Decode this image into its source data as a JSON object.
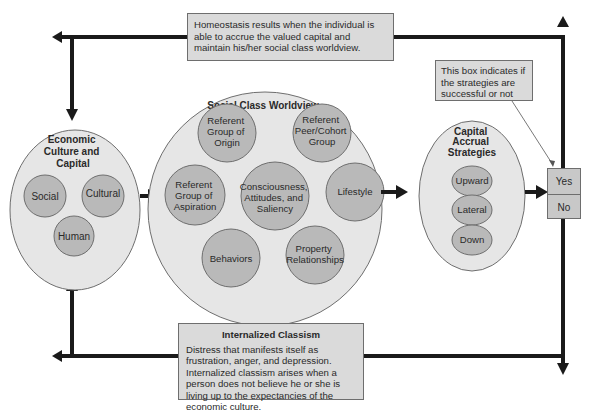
{
  "top_box": {
    "text": "Homeostasis results when the individual is able to accrue the valued capital and maintain his/her social class worldview."
  },
  "note_box": {
    "text": "This box indicates if the strategies are successful or not"
  },
  "economic": {
    "title_lines": [
      "Economic",
      "Culture and",
      "Capital"
    ],
    "items": [
      "Social",
      "Cultural",
      "Human"
    ]
  },
  "worldview": {
    "title": "Social Class Worldview",
    "items": {
      "origin": [
        "Referent",
        "Group of",
        "Origin"
      ],
      "peer": [
        "Referent",
        "Peer/Cohort",
        "Group"
      ],
      "aspiration": [
        "Referent",
        "Group of",
        "Aspiration"
      ],
      "center": [
        "Consciousness,",
        "Attitudes, and",
        "Saliency"
      ],
      "lifestyle": [
        "Lifestyle"
      ],
      "behaviors": [
        "Behaviors"
      ],
      "property": [
        "Property",
        "Relationships"
      ]
    }
  },
  "strategies": {
    "title_lines": [
      "Capital",
      "Accrual",
      "Strategies"
    ],
    "items": [
      "Upward",
      "Lateral",
      "Down"
    ]
  },
  "outcome": {
    "yes": "Yes",
    "no": "No"
  },
  "bottom_box": {
    "title": "Internalized Classism",
    "text": "Distress that manifests itself as frustration, anger, and depression. Internalized classism arises when a person does not believe he or she is living up to the expectancies of the economic culture."
  },
  "colors": {
    "outer_fill": "#e6e6e6",
    "inner_fill": "#b9b9b9",
    "stroke": "#6e6e6e",
    "arrow": "#1a1a1a",
    "box_fill": "#dadada"
  }
}
